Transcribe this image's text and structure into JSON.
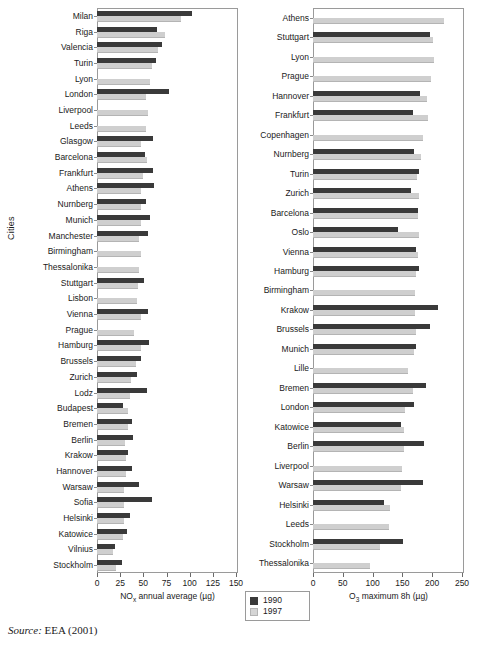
{
  "figure": {
    "y_axis_label": "Cities",
    "source_prefix": "Source:",
    "source_text": "EEA (2001)"
  },
  "legend": {
    "position": "below-left-panel",
    "entries": [
      {
        "label": "1990",
        "color": "#3a3a3a"
      },
      {
        "label": "1997",
        "color": "#d5d5d5"
      }
    ]
  },
  "chart_data": [
    {
      "type": "bar",
      "orientation": "horizontal",
      "id": "nox-panel",
      "title": "",
      "xlabel": "NOx annual average (µg)",
      "xlabel_base": "NO",
      "xlabel_sub": "x",
      "xlabel_rest": " annual average (µg)",
      "ylabel": "Cities",
      "xlim": [
        0,
        150
      ],
      "xticks": [
        0,
        25,
        50,
        75,
        100,
        125,
        150
      ],
      "grid": false,
      "legend_position": "bottom-right-outside",
      "categories": [
        "Milan",
        "Riga",
        "Valencia",
        "Turin",
        "Lyon",
        "London",
        "Liverpool",
        "Leeds",
        "Glasgow",
        "Barcelona",
        "Frankfurt",
        "Athens",
        "Nurnberg",
        "Munich",
        "Manchester",
        "Birmingham",
        "Thessalonika",
        "Stuttgart",
        "Lisbon",
        "Vienna",
        "Prague",
        "Hamburg",
        "Brussels",
        "Zurich",
        "Lodz",
        "Budapest",
        "Bremen",
        "Berlin",
        "Krakow",
        "Hannover",
        "Warsaw",
        "Sofia",
        "Helsinki",
        "Katowice",
        "Vilnius",
        "Stockholm"
      ],
      "series": [
        {
          "name": "1990",
          "color": "#3a3a3a",
          "values": [
            103,
            65,
            70,
            64,
            0,
            78,
            0,
            0,
            60,
            52,
            60,
            61,
            53,
            57,
            55,
            0,
            0,
            51,
            0,
            55,
            0,
            56,
            48,
            43,
            54,
            28,
            38,
            39,
            33,
            38,
            45,
            59,
            36,
            32,
            19,
            27
          ]
        },
        {
          "name": "1997",
          "color": "#d5d5d5",
          "values": [
            91,
            73,
            66,
            59,
            57,
            53,
            55,
            53,
            48,
            54,
            50,
            47,
            48,
            48,
            45,
            48,
            45,
            44,
            43,
            47,
            40,
            48,
            42,
            37,
            36,
            33,
            33,
            30,
            31,
            31,
            29,
            29,
            29,
            28,
            17,
            20
          ]
        }
      ]
    },
    {
      "type": "bar",
      "orientation": "horizontal",
      "id": "o3-panel",
      "title": "",
      "xlabel": "O3 maximum 8h (µg)",
      "xlabel_base": "O",
      "xlabel_sub": "3",
      "xlabel_rest": " maximum 8h (µg)",
      "ylabel": "",
      "xlim": [
        0,
        250
      ],
      "xticks": [
        0,
        50,
        100,
        150,
        200,
        250
      ],
      "grid": false,
      "categories": [
        "Athens",
        "Stuttgart",
        "Lyon",
        "Prague",
        "Hannover",
        "Frankfurt",
        "Copenhagen",
        "Nurnberg",
        "Turin",
        "Zurich",
        "Barcelona",
        "Oslo",
        "Vienna",
        "Hamburg",
        "Birmingham",
        "Krakow",
        "Brussels",
        "Munich",
        "Lille",
        "Bremen",
        "London",
        "Katowice",
        "Berlin",
        "Liverpool",
        "Warsaw",
        "Helsinki",
        "Leeds",
        "Stockholm",
        "Thessalonika"
      ],
      "series": [
        {
          "name": "1990",
          "color": "#3a3a3a",
          "values": [
            0,
            196,
            0,
            0,
            180,
            168,
            0,
            170,
            178,
            165,
            177,
            142,
            172,
            178,
            0,
            210,
            197,
            172,
            0,
            190,
            170,
            148,
            187,
            0,
            185,
            119,
            0,
            151,
            0
          ]
        },
        {
          "name": "1997",
          "color": "#d5d5d5",
          "values": [
            220,
            202,
            203,
            198,
            192,
            193,
            185,
            181,
            175,
            178,
            176,
            178,
            176,
            172,
            171,
            171,
            172,
            170,
            160,
            168,
            155,
            152,
            153,
            150,
            148,
            130,
            127,
            113,
            96
          ]
        }
      ]
    }
  ]
}
